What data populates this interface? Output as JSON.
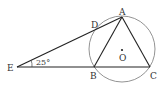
{
  "diagram": {
    "points": {
      "A": {
        "label": "A",
        "x": 122,
        "y": 17
      },
      "B": {
        "label": "B",
        "x": 94,
        "y": 67
      },
      "C": {
        "label": "C",
        "x": 150,
        "y": 67
      },
      "D": {
        "label": "D",
        "x": 97,
        "y": 29
      },
      "E": {
        "label": "E",
        "x": 17,
        "y": 67
      },
      "O": {
        "label": "O",
        "x": 122,
        "y": 50
      }
    },
    "angle_label": "25°",
    "circle": {
      "cx": 122,
      "cy": 49,
      "r": 33
    }
  }
}
